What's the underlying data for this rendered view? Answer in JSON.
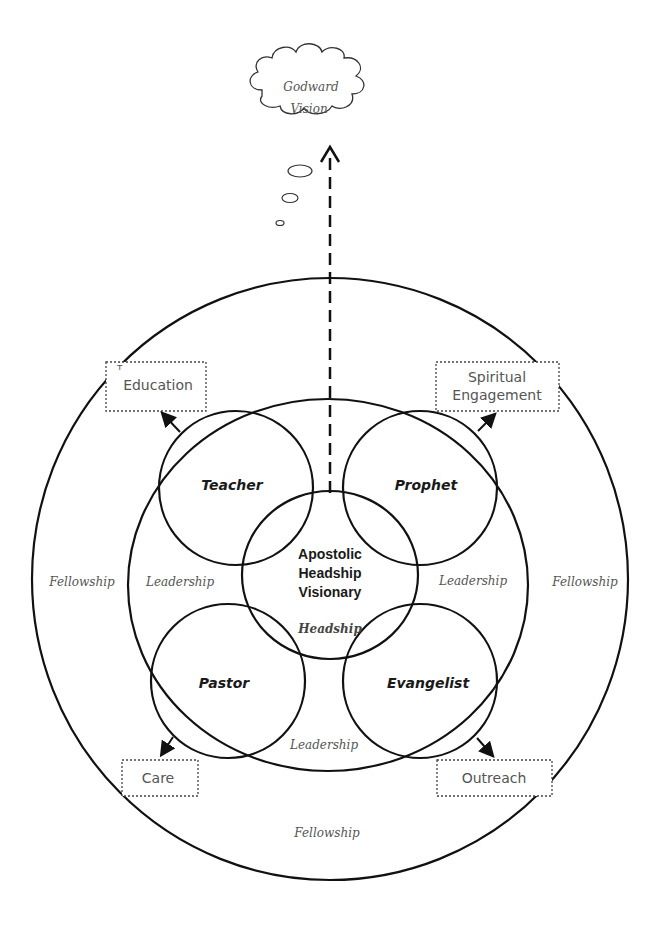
{
  "diagram": {
    "cloud": {
      "line1": "Godward",
      "line2": "Vision"
    },
    "center": {
      "line1": "Apostolic",
      "line2": "Headship",
      "line3": "Visionary",
      "sublabel": "Headship"
    },
    "roles": {
      "teacher": "Teacher",
      "prophet": "Prophet",
      "pastor": "Pastor",
      "evangelist": "Evangelist"
    },
    "ring_labels": {
      "leadership_left": "Leadership",
      "leadership_right": "Leadership",
      "leadership_bottom": "Leadership",
      "fellowship_left": "Fellowship",
      "fellowship_right": "Fellowship",
      "fellowship_bottom": "Fellowship"
    },
    "outcome_boxes": {
      "education": "Education",
      "education_prefix": "ᵀ",
      "spiritual_line1": "Spiritual",
      "spiritual_line2": "Engagement",
      "care": "Care",
      "outreach": "Outreach"
    },
    "colors": {
      "stroke": "#111111",
      "text_gray": "#555555",
      "text_dark": "#1a1a1a",
      "background": "#ffffff"
    }
  }
}
